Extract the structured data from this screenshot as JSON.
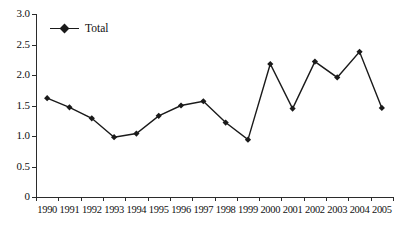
{
  "chart_data": {
    "type": "line",
    "title": "",
    "xlabel": "",
    "ylabel": "",
    "categories": [
      "1990",
      "1991",
      "1992",
      "1993",
      "1994",
      "1995",
      "1996",
      "1997",
      "1998",
      "1999",
      "2000",
      "2001",
      "2002",
      "2003",
      "2004",
      "2005"
    ],
    "series": [
      {
        "name": "Total",
        "color": "#1a1a1a",
        "marker": "diamond",
        "values": [
          1.62,
          1.47,
          1.29,
          0.98,
          1.04,
          1.33,
          1.5,
          1.57,
          1.22,
          0.94,
          2.18,
          1.45,
          2.22,
          1.96,
          2.38,
          1.46
        ]
      }
    ],
    "ylim": [
      0,
      3.0
    ],
    "y_ticks": [
      0,
      0.5,
      1.0,
      1.5,
      2.0,
      2.5,
      3.0
    ],
    "y_tick_labels": [
      "0",
      "0.5",
      "1.0",
      "1.5",
      "2.0",
      "2.5",
      "3.0"
    ],
    "grid": false,
    "legend_position": "top-left"
  },
  "legend": {
    "entries": [
      {
        "label": "Total"
      }
    ]
  },
  "axes": {
    "y_tick_labels": [
      "3.0",
      "2.5",
      "2.0",
      "1.5",
      "1.0",
      "0.5",
      "0"
    ],
    "x_tick_labels": [
      "1990",
      "1991",
      "1992",
      "1993",
      "1994",
      "1995",
      "1996",
      "1997",
      "1998",
      "1999",
      "2000",
      "2001",
      "2002",
      "2003",
      "2004",
      "2005"
    ]
  }
}
